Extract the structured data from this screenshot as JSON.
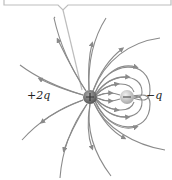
{
  "diagram": {
    "charges": [
      {
        "id": "positive",
        "label": "+2q",
        "sign": "+",
        "x": 90,
        "y": 97,
        "r": 7,
        "color": "#6f6f6f"
      },
      {
        "id": "negative",
        "label": "−q",
        "sign": "−",
        "x": 127,
        "y": 97,
        "r": 7,
        "color": "#c9c9c9"
      }
    ],
    "line_color": "#8a8a8a",
    "callout_color": "#bdbdbd"
  }
}
